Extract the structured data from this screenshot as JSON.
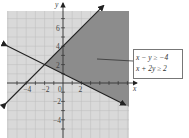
{
  "chart_data": {
    "type": "region",
    "title": "",
    "xlabel": "x",
    "ylabel": "y",
    "xlim": [
      -6,
      7
    ],
    "ylim": [
      -6,
      8
    ],
    "grid": true,
    "x_tick_labels": [
      "-4",
      "-2",
      "0",
      "2"
    ],
    "y_tick_labels": [
      "6",
      "4",
      "2",
      "-2",
      "-4"
    ],
    "lines": [
      {
        "name": "x - y = -4",
        "slope": 1,
        "intercept": 4
      },
      {
        "name": "x + 2y = 2",
        "slope": -0.5,
        "intercept": 1
      }
    ],
    "intersection": [
      -2,
      2
    ],
    "shaded_region": "x - y ≥ -4 and x + 2y ≥ 2",
    "legend": [
      "x − y ≥ −4",
      "x + 2y ≥ 2"
    ],
    "colors": {
      "background_shade": "#d9d9d9",
      "solution_shade": "#8c8c8c",
      "grid": "#bdbdbd",
      "axis": "#333333",
      "line": "#222222"
    }
  },
  "legend": {
    "line1": "x − y ≥ −4",
    "line2": "x + 2y ≥ 2"
  },
  "axes": {
    "x_label": "x",
    "y_label": "y",
    "origin_label": "0"
  }
}
